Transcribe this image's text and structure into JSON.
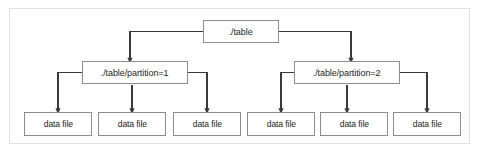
{
  "diagram": {
    "background_color": "#ffffff",
    "frame_border_color": "#e2e2e2",
    "node_border_color": "#8d8d8d",
    "node_fill_color": "#ffffff",
    "connector_color": "#3a3a3a",
    "text_color": "#262626"
  },
  "nodes": {
    "root": {
      "label": "./table",
      "level": "root"
    },
    "partitions": [
      {
        "label": "./table/partition=1"
      },
      {
        "label": "./table/partition=2"
      }
    ],
    "leaves": [
      {
        "label": "data file"
      },
      {
        "label": "data file"
      },
      {
        "label": "data file"
      },
      {
        "label": "data file"
      },
      {
        "label": "data file"
      },
      {
        "label": "data file"
      }
    ]
  }
}
